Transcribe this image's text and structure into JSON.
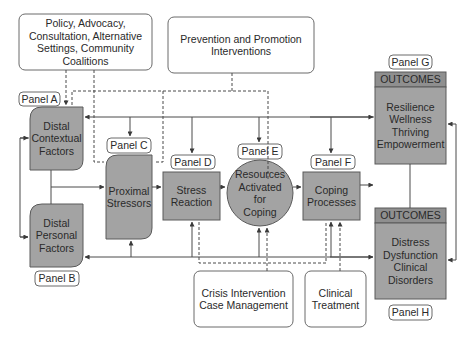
{
  "diagram": {
    "intervention_boxes": [
      {
        "id": "policy",
        "text": "Policy, Advocacy,\nConsultation, Alternative\nSettings, Community\nCoalitions"
      },
      {
        "id": "prevention",
        "text": "Prevention and Promotion\nInterventions"
      },
      {
        "id": "crisis",
        "text": "Crisis Intervention\nCase Management"
      },
      {
        "id": "clinical",
        "text": "Clinical\nTreatment"
      }
    ],
    "panels": {
      "A": "Panel A",
      "B": "Panel B",
      "C": "Panel C",
      "D": "Panel D",
      "E": "Panel E",
      "F": "Panel F",
      "G": "Panel G",
      "H": "Panel H"
    },
    "nodes": {
      "distal_contextual": "Distal\nContextual\nFactors",
      "distal_personal": "Distal\nPersonal\nFactors",
      "proximal_stressors": "Proximal\nStressors",
      "stress_reaction": "Stress\nReaction",
      "resources": "Resources\nActivated\nfor\nCoping",
      "coping": "Coping\nProcesses",
      "outcomes_positive_header": "OUTCOMES",
      "outcomes_positive": "Resilience\nWellness\nThriving\nEmpowerment",
      "outcomes_negative_header": "OUTCOMES",
      "outcomes_negative": "Distress\nDysfunction\nClinical\nDisorders"
    },
    "colors": {
      "node_fill": "#a3a3a3",
      "header_fill": "#8f8f8f",
      "line": "#4a4a4a",
      "box_border": "#6a6a6a"
    }
  }
}
